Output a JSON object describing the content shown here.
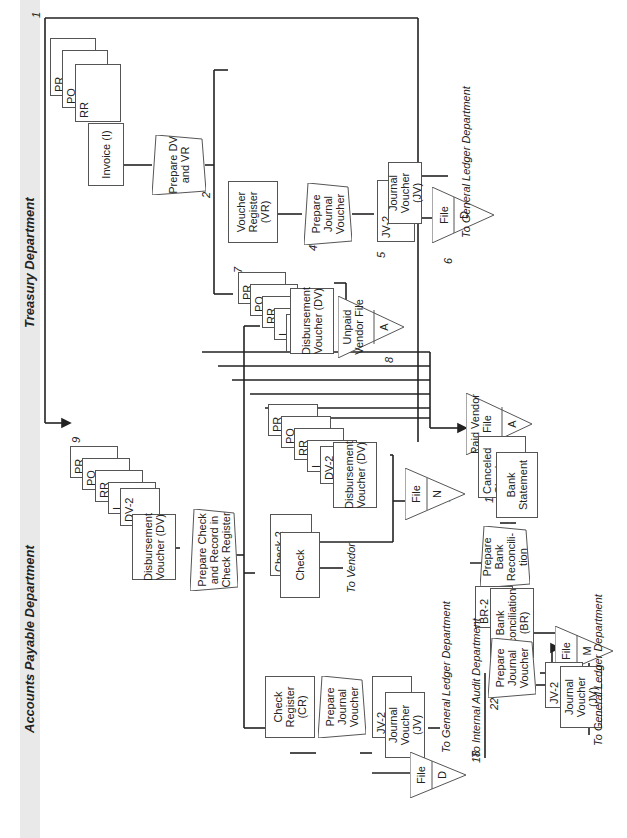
{
  "departments": {
    "accounts_payable": "Accounts Payable Department",
    "treasury": "Treasury Department"
  },
  "steps": {
    "s1": {
      "num": "1",
      "docs": [
        "PR",
        "PO",
        "RR",
        "Invoice (I)"
      ]
    },
    "s2": {
      "num": "2",
      "label": "Prepare DV and VR"
    },
    "s3": {
      "num": "3",
      "label": "Voucher Register (VR)"
    },
    "s4": {
      "num": "4",
      "label": "Prepare Journal Voucher"
    },
    "s5": {
      "num": "5",
      "tag": "JV-2",
      "label": "Journal Voucher (JV)"
    },
    "s6": {
      "num": "6",
      "label": "File",
      "code": "D"
    },
    "s7": {
      "num": "7",
      "docs": [
        "PR",
        "PO",
        "RR",
        "I",
        "DV-2",
        "Disbursement Voucher (DV)"
      ]
    },
    "s8": {
      "num": "8",
      "label": "Unpaid Vendor File",
      "code": "A"
    },
    "s9": {
      "num": "9",
      "docs": [
        "PR",
        "PO",
        "RR",
        "I",
        "DV-2",
        "Disbursement Voucher (DV)"
      ]
    },
    "s10": {
      "num": "10",
      "label": "Prepare Check and Record in Check Register"
    },
    "s11": {
      "num": "11",
      "docs": [
        "PR",
        "PO",
        "RR",
        "I",
        "DV-2",
        "Disbursement Voucher (DV)"
      ]
    },
    "s12": {
      "num": "12",
      "label": "Paid Vendor File",
      "code": "A"
    },
    "s13": {
      "num": "13",
      "tag": "Check-2",
      "label": "Check"
    },
    "s14": {
      "num": "14",
      "label": "File",
      "code": "N"
    },
    "s15": {
      "num": "15",
      "label": "Check Register (CR)"
    },
    "s16": {
      "num": "16",
      "label": "Prepare Journal Voucher"
    },
    "s17": {
      "num": "17",
      "tag": "JV-2",
      "label": "Journal Voucher (JV)"
    },
    "s18": {
      "num": "18",
      "label": "File",
      "code": "D"
    },
    "s19": {
      "num": "19",
      "docs": [
        "Canceled Checks",
        "Bank Statement"
      ]
    },
    "s20": {
      "num": "20",
      "label": "Prepare Bank Reconcili-tion"
    },
    "s21": {
      "num": "21",
      "tag": "BR-2",
      "label": "Bank Reconciliation (BR)"
    },
    "s22": {
      "num": "22",
      "label": "Prepare Journal Voucher"
    },
    "s23": {
      "num": "23",
      "label": "File",
      "code": "M"
    },
    "s24": {
      "num": "24",
      "tag": "JV-2",
      "label": "Journal Voucher (JV)"
    }
  },
  "destinations": {
    "gl_ap": "To General Ledger Department",
    "vendor": "To Vendor",
    "gl_treasury": "To General Ledger Department",
    "internal_audit": "To Internal Audit Department",
    "gl_recon": "To General Ledger Department"
  },
  "colors": {
    "band": "#e9e9e9",
    "line": "#222222",
    "shape_border": "#555555"
  }
}
